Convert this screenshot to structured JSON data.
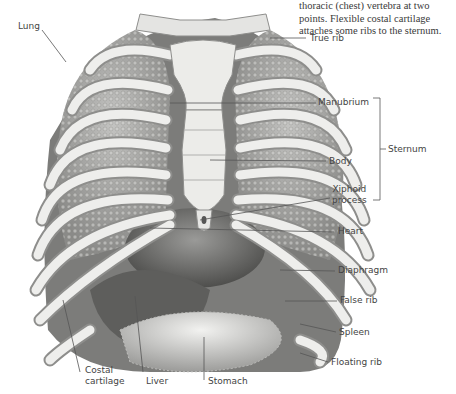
{
  "caption": {
    "lines": [
      "thoracic (chest) vertebra at two",
      "points. Flexible costal cartilage",
      "attaches some ribs to the sternum."
    ]
  },
  "labels": {
    "lung": "Lung",
    "true_rib": "True rib",
    "manubrium": "Manubrium",
    "sternum": "Sternum",
    "body": "Body",
    "xiphoid_process": [
      "Xiphoid",
      "process"
    ],
    "heart": "Heart",
    "diaphragm": "Diaphragm",
    "false_rib": "False rib",
    "spleen": "Spleen",
    "floating_rib": "Floating rib",
    "costal_cartilage": [
      "Costal",
      "cartilage"
    ],
    "liver": "Liver",
    "stomach": "Stomach"
  },
  "colors": {
    "background": "#ffffff",
    "bone": "#e8e8e6",
    "bone_shadow": "#9a9a98",
    "lung": "#a9a9a7",
    "organ": "#6e6e6c",
    "leader_line": "#555555",
    "text": "#444444"
  }
}
